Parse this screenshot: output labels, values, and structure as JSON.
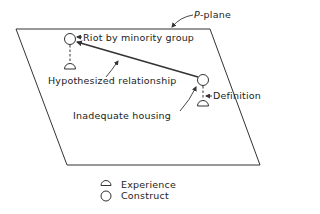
{
  "diagram": {
    "plane_label_prefix": "P",
    "plane_label_suffix": "-plane",
    "nodes": {
      "top_construct": "Riot by minority group",
      "bottom_construct": "Inadequate housing"
    },
    "annotations": {
      "relationship": "Hypothesized relationship",
      "definition": "Definition"
    },
    "legend": [
      {
        "symbol": "experience-symbol",
        "label": "Experience"
      },
      {
        "symbol": "construct-symbol",
        "label": "Construct"
      }
    ],
    "colors": {
      "stroke": "#333333",
      "background": "#ffffff"
    }
  }
}
